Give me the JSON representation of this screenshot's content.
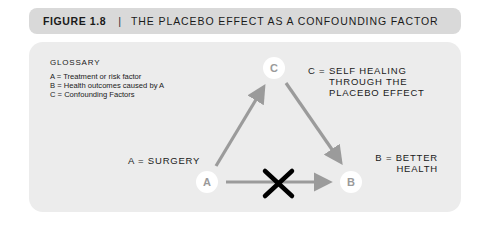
{
  "header": {
    "figure_number": "FIGURE 1.8",
    "separator": "|",
    "title": "THE PLACEBO EFFECT AS A CONFOUNDING FACTOR"
  },
  "glossary": {
    "title": "GLOSSARY",
    "items": [
      "A = Treatment or risk factor",
      "B = Health outcomes caused by A",
      "C = Confounding Factors"
    ]
  },
  "nodes": {
    "a": {
      "letter": "A",
      "label": "A = SURGERY"
    },
    "b": {
      "letter": "B",
      "label_line1": "B = BETTER",
      "label_line2": "HEALTH"
    },
    "c": {
      "letter": "C",
      "label_line1": "C = SELF HEALING",
      "label_line2": "THROUGH THE",
      "label_line3": "PLACEBO EFFECT"
    }
  },
  "edges": [
    {
      "from": "A",
      "to": "C",
      "style": "arrow"
    },
    {
      "from": "C",
      "to": "B",
      "style": "arrow"
    },
    {
      "from": "A",
      "to": "B",
      "style": "arrow",
      "crossed_out": true
    }
  ],
  "colors": {
    "header_bg": "#d9d9d9",
    "panel_bg": "#ececec",
    "arrow": "#9b9b9b",
    "node_fill": "#ffffff",
    "cross": "#000000"
  }
}
